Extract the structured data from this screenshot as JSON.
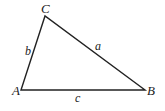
{
  "diagram": {
    "type": "triangle",
    "vertices": [
      {
        "label": "A",
        "x": 21,
        "y": 90,
        "lx": 12,
        "ly": 95
      },
      {
        "label": "B",
        "x": 145,
        "y": 90,
        "lx": 148,
        "ly": 95
      },
      {
        "label": "C",
        "x": 45,
        "y": 16,
        "lx": 41,
        "ly": 13
      }
    ],
    "sides": [
      {
        "label": "a",
        "from": "C",
        "to": "B",
        "lx": 95,
        "ly": 50
      },
      {
        "label": "b",
        "from": "A",
        "to": "C",
        "lx": 25,
        "ly": 55
      },
      {
        "label": "c",
        "from": "A",
        "to": "B",
        "lx": 75,
        "ly": 102
      }
    ],
    "stroke_color": "#222222"
  }
}
